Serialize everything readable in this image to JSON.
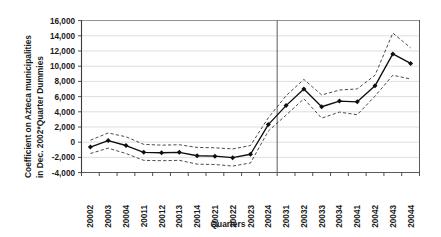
{
  "chart_data": {
    "type": "line",
    "title": "",
    "xlabel": "Quarters",
    "ylabel": "Coefficient on Azteca municipalities in Dec. 2002*Quarter Dummies",
    "ylabel_line1": "Coefficient on Azteca municipalities",
    "ylabel_line2": "in Dec. 2002*Quarter Dummies",
    "ylim": [
      -4000,
      16000
    ],
    "ytick_step": 2000,
    "ytick_labels": [
      "16,000",
      "14,000",
      "12,000",
      "10,000",
      "8,000",
      "6,000",
      "4,000",
      "2,000",
      "0",
      "-2,000",
      "-4,000"
    ],
    "ytick_values": [
      16000,
      14000,
      12000,
      10000,
      8000,
      6000,
      4000,
      2000,
      0,
      -2000,
      -4000
    ],
    "grid": true,
    "legend": "none",
    "categories": [
      "20002",
      "20003",
      "20004",
      "20011",
      "20012",
      "20013",
      "20014",
      "20021",
      "20022",
      "20023",
      "20024",
      "20031",
      "20032",
      "20033",
      "20034",
      "20041",
      "20042",
      "20043",
      "20044"
    ],
    "series": [
      {
        "name": "Coefficient",
        "style": "solid-with-markers",
        "color": "#0f0f0f",
        "values": [
          -650,
          200,
          -450,
          -1350,
          -1400,
          -1350,
          -1800,
          -1850,
          -2050,
          -1600,
          2300,
          4800,
          7000,
          4650,
          5400,
          5300,
          7400,
          11600,
          10350
        ]
      },
      {
        "name": "Upper 95% confidence bound",
        "style": "dashed",
        "color": "#2a2a2a",
        "values": [
          250,
          1200,
          700,
          -300,
          -400,
          -350,
          -700,
          -750,
          -900,
          -450,
          3200,
          6100,
          8250,
          6200,
          6850,
          7000,
          8800,
          14350,
          12400
        ]
      },
      {
        "name": "Lower 95% confidence bound",
        "style": "dashed",
        "color": "#2a2a2a",
        "values": [
          -1500,
          -800,
          -1500,
          -2400,
          -2450,
          -2400,
          -2900,
          -2950,
          -3150,
          -2750,
          1450,
          3550,
          5700,
          3150,
          3950,
          3600,
          6050,
          8800,
          8300
        ]
      }
    ],
    "annotations": [
      {
        "name": "event-divider",
        "type": "vertical-line",
        "after_category": "20024",
        "at_index": 10.5
      }
    ]
  }
}
